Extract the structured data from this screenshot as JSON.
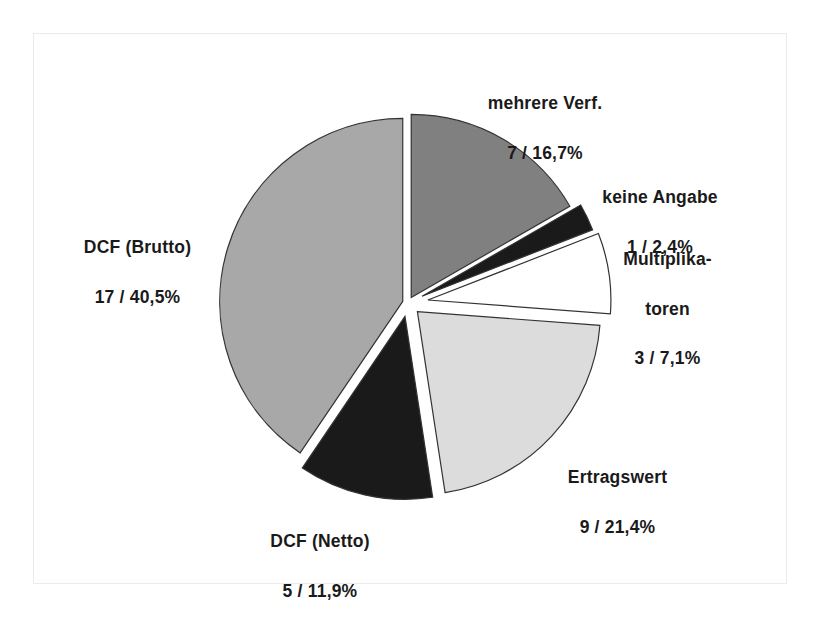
{
  "chart_data": {
    "type": "pie",
    "title": "",
    "subtitle": "",
    "xlabel": "",
    "ylabel": "",
    "legend": "none",
    "grid": false,
    "total_count": 42,
    "label_format": "count / percent",
    "categories": [
      "mehrere Verf.",
      "keine Angabe",
      "Multiplikatoren",
      "Ertragswert",
      "DCF (Netto)",
      "DCF (Brutto)"
    ],
    "counts": [
      7,
      1,
      3,
      9,
      5,
      17
    ],
    "values": [
      16.7,
      2.4,
      7.1,
      21.4,
      11.9,
      40.5
    ],
    "slices": [
      {
        "name": "mehrere Verf.",
        "label_line1": "mehrere Verf.",
        "label_line2": "7 / 16,7%",
        "count": 7,
        "percent": 16.7,
        "color": "#808080",
        "start_angle": 0.0,
        "end_angle": 60.1,
        "explode": 0.035
      },
      {
        "name": "keine Angabe",
        "label_line1": "keine Angabe",
        "label_line2": "1 / 2,4%",
        "count": 1,
        "percent": 2.4,
        "color": "#1a1a1a",
        "start_angle": 60.1,
        "end_angle": 68.7,
        "explode": 0.085
      },
      {
        "name": "Multiplikatoren",
        "label_line1": "Multiplika-",
        "label_line2": "toren",
        "label_line3": "3 / 7,1%",
        "count": 3,
        "percent": 7.1,
        "color": "#ffffff",
        "start_angle": 68.7,
        "end_angle": 94.3,
        "explode": 0.11
      },
      {
        "name": "Ertragswert",
        "label_line1": "Ertragswert",
        "label_line2": "9 / 21,4%",
        "count": 9,
        "percent": 21.4,
        "color": "#dcdcdc",
        "start_angle": 94.3,
        "end_angle": 171.3,
        "explode": 0.07
      },
      {
        "name": "DCF (Netto)",
        "label_line1": "DCF (Netto)",
        "label_line2": "5 / 11,9%",
        "count": 5,
        "percent": 11.9,
        "color": "#1a1a1a",
        "start_angle": 171.3,
        "end_angle": 214.1,
        "explode": 0.075
      },
      {
        "name": "DCF (Brutto)",
        "label_line1": "DCF (Brutto)",
        "label_line2": "17 / 40,5%",
        "count": 17,
        "percent": 40.5,
        "color": "#a8a8a8",
        "start_angle": 214.1,
        "end_angle": 360.0,
        "explode": 0.03
      }
    ],
    "geometry": {
      "center_x": 408,
      "center_y": 303,
      "radius": 183,
      "stroke": "#333333",
      "stroke_width": 1.2
    }
  },
  "labels": {
    "mehrere_verf": {
      "name": "mehrere Verf.",
      "value": "7 / 16,7%"
    },
    "keine_angabe": {
      "name": "keine Angabe",
      "value": "1 / 2,4%"
    },
    "multiplikatoren": {
      "name_line1": "Multiplika-",
      "name_line2": "toren",
      "value": "3 / 7,1%"
    },
    "ertragswert": {
      "name": "Ertragswert",
      "value": "9 / 21,4%"
    },
    "dcf_netto": {
      "name": "DCF (Netto)",
      "value": "5 / 11,9%"
    },
    "dcf_brutto": {
      "name": "DCF (Brutto)",
      "value": "17 / 40,5%"
    }
  }
}
